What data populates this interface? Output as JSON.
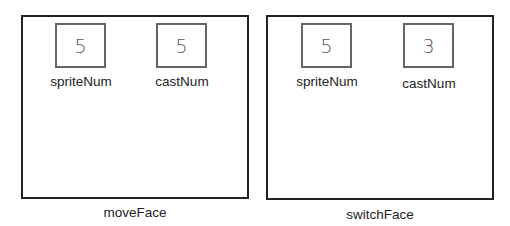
{
  "diagrams": [
    {
      "caption": "moveFace",
      "fields": [
        {
          "label": "spriteNum",
          "value": "5"
        },
        {
          "label": "castNum",
          "value": "5"
        }
      ]
    },
    {
      "caption": "switchFace",
      "fields": [
        {
          "label": "spriteNum",
          "value": "5"
        },
        {
          "label": "castNum",
          "value": "3"
        }
      ]
    }
  ]
}
